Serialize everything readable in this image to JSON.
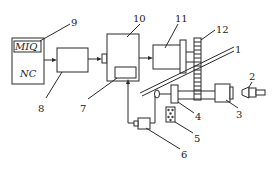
{
  "diagram": {
    "type": "machine control schematic",
    "nc_unit": {
      "title": "NC",
      "sub_label": "MIQ"
    },
    "labels": {
      "l1": "1",
      "l2": "2",
      "l3": "3",
      "l4": "4",
      "l5": "5",
      "l6": "6",
      "l7": "7",
      "l8": "8",
      "l9": "9",
      "l10": "10",
      "l11": "11",
      "l12": "12"
    },
    "components": [
      {
        "id": "1",
        "name": "inclined guide rod"
      },
      {
        "id": "2",
        "name": "tool / workpiece"
      },
      {
        "id": "3",
        "name": "spindle chuck"
      },
      {
        "id": "4",
        "name": "carriage block"
      },
      {
        "id": "5",
        "name": "sensor element"
      },
      {
        "id": "6",
        "name": "encoder"
      },
      {
        "id": "7",
        "name": "interface card"
      },
      {
        "id": "8",
        "name": "drive amplifier"
      },
      {
        "id": "9",
        "name": "MIQ module"
      },
      {
        "id": "10",
        "name": "control unit"
      },
      {
        "id": "11",
        "name": "servo motor"
      },
      {
        "id": "12",
        "name": "gear wheel"
      }
    ],
    "colors": {
      "line": "#2a2a2a",
      "background": "#ffffff"
    }
  }
}
